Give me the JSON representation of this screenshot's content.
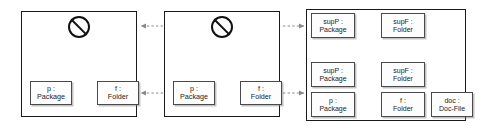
{
  "diagram": {
    "panel_count": 3,
    "colors": {
      "panel_border": "#1a1a1a",
      "box_border": "#4a4a4a",
      "box_fill": "#fdfdfd",
      "arrow_fill": "#6e6e6e",
      "connector_line": "#8a8a8a",
      "text": "#1c1c1c",
      "page_background": "#ffffff"
    },
    "panels": [
      {
        "id": "panel-1",
        "name": "left-panel",
        "forbidden_symbol": "no-entry-icon",
        "big_arrow": "down-arrow-icon",
        "objects": [
          {
            "id": "p1-left",
            "name": "p",
            "type": "Package",
            "label_line1": "p :",
            "label_line2": "Package"
          },
          {
            "id": "p1-right",
            "name": "f",
            "type": "Folder",
            "label_line1": "f :",
            "label_line2": "Folder"
          }
        ],
        "links": [
          {
            "from": "p1-left",
            "to": "p1-right",
            "style": "hexagon-bidirectional"
          }
        ]
      },
      {
        "id": "panel-2",
        "name": "middle-panel",
        "forbidden_symbol": "no-entry-icon",
        "big_arrow": "down-arrow-icon",
        "objects": [
          {
            "id": "p2-left",
            "name": "p",
            "type": "Package",
            "label_line1": "p :",
            "label_line2": "Package"
          },
          {
            "id": "p2-right",
            "name": "f",
            "type": "Folder",
            "label_line1": "f :",
            "label_line2": "Folder"
          }
        ],
        "links": [
          {
            "from": "p2-left",
            "to": "p2-right",
            "style": "hexagon-bidirectional"
          }
        ]
      },
      {
        "id": "panel-3",
        "name": "right-panel",
        "forbidden_symbol": null,
        "big_arrow": "down-arrow-icon",
        "objects": [
          {
            "id": "p3-supP-top",
            "name": "supP",
            "type": "Package",
            "label_line1": "supP :",
            "label_line2": "Package"
          },
          {
            "id": "p3-supF-top",
            "name": "supF",
            "type": "Folder",
            "label_line1": "supF :",
            "label_line2": "Folder"
          },
          {
            "id": "p3-supP-mid",
            "name": "supP",
            "type": "Package",
            "label_line1": "supP :",
            "label_line2": "Package"
          },
          {
            "id": "p3-supF-mid",
            "name": "supF",
            "type": "Folder",
            "label_line1": "supF :",
            "label_line2": "Folder"
          },
          {
            "id": "p3-p",
            "name": "p",
            "type": "Package",
            "label_line1": "p :",
            "label_line2": "Package"
          },
          {
            "id": "p3-f",
            "name": "f",
            "type": "Folder",
            "label_line1": "f :",
            "label_line2": "Folder"
          },
          {
            "id": "p3-doc",
            "name": "doc",
            "type": "Doc-File",
            "label_line1": "doc :",
            "label_line2": "Doc-File"
          }
        ],
        "links": [
          {
            "from": "p3-supP-top",
            "to": "p3-supF-top",
            "style": "hexagon-bidirectional"
          },
          {
            "from": "p3-supP-mid",
            "to": "p3-supF-mid",
            "style": "hexagon-bidirectional"
          },
          {
            "from": "p3-p",
            "to": "p3-f",
            "style": "hexagon-bidirectional"
          },
          {
            "from": "p3-supP-mid",
            "to": "p3-p",
            "style": "vertical-arrow"
          },
          {
            "from": "p3-supF-mid",
            "to": "p3-f",
            "style": "vertical-arrow"
          },
          {
            "from": "p3-f",
            "to": "p3-doc",
            "style": "horizontal-arrow"
          }
        ]
      }
    ],
    "inter_panel_connectors": [
      {
        "id": "c1",
        "from": "panel-2",
        "to": "panel-1",
        "direction": "left",
        "style": "dotted-arrow",
        "row": "top"
      },
      {
        "id": "c2",
        "from": "panel-2",
        "to": "panel-1",
        "direction": "left",
        "style": "dotted-arrow",
        "row": "bottom"
      },
      {
        "id": "c3",
        "from": "panel-2",
        "to": "panel-3",
        "direction": "right",
        "style": "dotted-arrow",
        "row": "top"
      },
      {
        "id": "c4",
        "from": "panel-2",
        "to": "panel-3",
        "direction": "right",
        "style": "dotted-arrow",
        "row": "bottom"
      }
    ]
  }
}
